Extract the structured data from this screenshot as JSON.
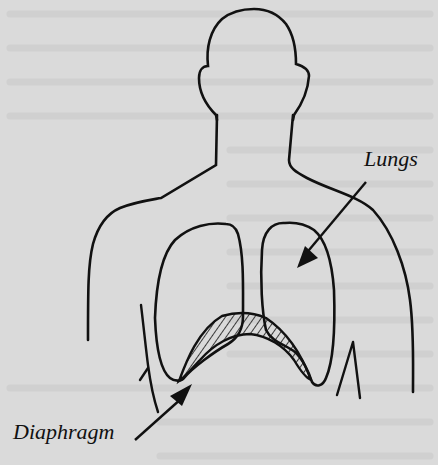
{
  "diagram": {
    "labels": {
      "lungs": "Lungs",
      "diaphragm": "Diaphragm"
    },
    "colors": {
      "background": "#dadada",
      "ink": "#111111",
      "bleed_text": "#c6c6c6"
    }
  }
}
